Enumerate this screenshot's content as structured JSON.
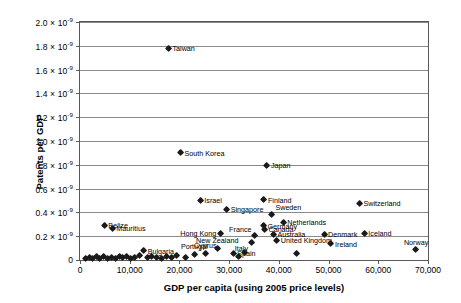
{
  "chart_data": {
    "type": "scatter",
    "title": "",
    "xlabel": "GDP per capita (using 2005 price levels)",
    "ylabel": "Patents per GDP",
    "xlim": [
      0,
      70000
    ],
    "ylim": [
      0,
      2e-09
    ],
    "grid": true,
    "legend": "none",
    "xticks": [
      "0",
      "10,000",
      "20,000",
      "30,000",
      "40,000",
      "50,000",
      "60,000",
      "70,000"
    ],
    "xtick_values": [
      0,
      10000,
      20000,
      30000,
      40000,
      50000,
      60000,
      70000
    ],
    "yticks": [
      "0",
      "0.2 × 10⁻⁹",
      "0.4 × 10⁻⁹",
      "0.6 × 10⁻⁹",
      "0.8 × 10⁻⁹",
      "1.0 × 10⁻⁹",
      "1.2 × 10⁻⁹",
      "1.4 × 10⁻⁹",
      "1.6 × 10⁻⁹",
      "1.8 × 10⁻⁹",
      "2.0 × 10⁻⁹"
    ],
    "ytick_mantissas": [
      "0",
      "0.2",
      "0.4",
      "0.6",
      "0.8",
      "1.0",
      "1.2",
      "1.4",
      "1.6",
      "1.8",
      "2.0"
    ],
    "ytick_values": [
      0,
      2e-10,
      4e-10,
      6e-10,
      8e-10,
      1e-09,
      1.2e-09,
      1.4e-09,
      1.6e-09,
      1.8e-09,
      2e-09
    ],
    "exponent_text": "× 10",
    "exponent_sup": "-9",
    "marker_color": "#1a1a1a",
    "grid_color": "#8a8a8d",
    "frame_color": "#59595b",
    "points": [
      {
        "label": "Taiwan",
        "x": 17800,
        "y": 1.78e-09,
        "pos": "right"
      },
      {
        "label": "South Korea",
        "x": 20200,
        "y": 9e-10,
        "pos": "right"
      },
      {
        "label": "Japan",
        "x": 37600,
        "y": 7.95e-10,
        "pos": "right"
      },
      {
        "label": "Israel",
        "x": 24200,
        "y": 5e-10,
        "pos": "right"
      },
      {
        "label": "Finland",
        "x": 37000,
        "y": 5.05e-10,
        "pos": "right"
      },
      {
        "label": "Switzerland",
        "x": 56200,
        "y": 4.75e-10,
        "pos": "right"
      },
      {
        "label": "Singapore",
        "x": 29500,
        "y": 4.25e-10,
        "pos": "right"
      },
      {
        "label": "Sweden",
        "x": 38600,
        "y": 3.85e-10,
        "pos": "ur"
      },
      {
        "label": "Netherlands",
        "x": 40900,
        "y": 3.15e-10,
        "pos": "right"
      },
      {
        "label": "Germany",
        "x": 36900,
        "y": 2.85e-10,
        "pos": "right"
      },
      {
        "label": "Belize",
        "x": 4900,
        "y": 2.92e-10,
        "pos": "right"
      },
      {
        "label": "Mauritius",
        "x": 6500,
        "y": 2.65e-10,
        "pos": "right"
      },
      {
        "label": "Canada",
        "x": 37100,
        "y": 2.55e-10,
        "pos": "right"
      },
      {
        "label": "Hong Kong",
        "x": 28200,
        "y": 2.25e-10,
        "pos": "left"
      },
      {
        "label": "Iceland",
        "x": 57200,
        "y": 2.25e-10,
        "pos": "right"
      },
      {
        "label": "Australia",
        "x": 38900,
        "y": 2.15e-10,
        "pos": "right"
      },
      {
        "label": "Denmark",
        "x": 49100,
        "y": 2.15e-10,
        "pos": "right"
      },
      {
        "label": "United Kingdom",
        "x": 39600,
        "y": 1.65e-10,
        "pos": "right"
      },
      {
        "label": "France",
        "x": 35200,
        "y": 2.05e-10,
        "pos": "ul"
      },
      {
        "label": "Ireland",
        "x": 50500,
        "y": 1.35e-10,
        "pos": "right"
      },
      {
        "label": "Italy",
        "x": 34500,
        "y": 1.45e-10,
        "pos": "ll"
      },
      {
        "label": "New Zealand",
        "x": 27600,
        "y": 9.5e-11,
        "pos": "above"
      },
      {
        "label": "Cyprus",
        "x": 25200,
        "y": 5.5e-11,
        "pos": "above"
      },
      {
        "label": "Portugal",
        "x": 23000,
        "y": 4.5e-11,
        "pos": "above"
      },
      {
        "label": "Spain",
        "x": 30800,
        "y": 5.5e-11,
        "pos": "right"
      },
      {
        "label": "Norway",
        "x": 67600,
        "y": 8.5e-11,
        "pos": "above"
      },
      {
        "label": "Bulgaria",
        "x": 12800,
        "y": 7.5e-11,
        "pos": "right"
      },
      {
        "label": "",
        "x": 1100,
        "y": 1.2e-11,
        "pos": "none"
      },
      {
        "label": "",
        "x": 1900,
        "y": 2e-11,
        "pos": "none"
      },
      {
        "label": "",
        "x": 2600,
        "y": 1e-11,
        "pos": "none"
      },
      {
        "label": "",
        "x": 3300,
        "y": 2.6e-11,
        "pos": "none"
      },
      {
        "label": "",
        "x": 4000,
        "y": 1.4e-11,
        "pos": "none"
      },
      {
        "label": "",
        "x": 4800,
        "y": 3e-11,
        "pos": "none"
      },
      {
        "label": "",
        "x": 5600,
        "y": 1.6e-11,
        "pos": "none"
      },
      {
        "label": "",
        "x": 6300,
        "y": 2.4e-11,
        "pos": "none"
      },
      {
        "label": "",
        "x": 7100,
        "y": 1.2e-11,
        "pos": "none"
      },
      {
        "label": "",
        "x": 7900,
        "y": 3.2e-11,
        "pos": "none"
      },
      {
        "label": "",
        "x": 8600,
        "y": 1.8e-11,
        "pos": "none"
      },
      {
        "label": "",
        "x": 9400,
        "y": 2.8e-11,
        "pos": "none"
      },
      {
        "label": "",
        "x": 10200,
        "y": 1.4e-11,
        "pos": "none"
      },
      {
        "label": "",
        "x": 11000,
        "y": 2.2e-11,
        "pos": "none"
      },
      {
        "label": "",
        "x": 11900,
        "y": 3.4e-11,
        "pos": "none"
      },
      {
        "label": "",
        "x": 13600,
        "y": 1.8e-11,
        "pos": "none"
      },
      {
        "label": "",
        "x": 14500,
        "y": 3e-11,
        "pos": "none"
      },
      {
        "label": "",
        "x": 15400,
        "y": 2.2e-11,
        "pos": "none"
      },
      {
        "label": "",
        "x": 16400,
        "y": 1.5e-11,
        "pos": "none"
      },
      {
        "label": "",
        "x": 17400,
        "y": 2.8e-11,
        "pos": "none"
      },
      {
        "label": "",
        "x": 18400,
        "y": 2e-11,
        "pos": "none"
      },
      {
        "label": "",
        "x": 19400,
        "y": 3.5e-11,
        "pos": "none"
      },
      {
        "label": "",
        "x": 21300,
        "y": 1.8e-11,
        "pos": "none"
      },
      {
        "label": "",
        "x": 31900,
        "y": 3e-11,
        "pos": "none"
      },
      {
        "label": "",
        "x": 33200,
        "y": 6e-11,
        "pos": "none"
      },
      {
        "label": "",
        "x": 43500,
        "y": 5.5e-11,
        "pos": "none"
      }
    ]
  }
}
